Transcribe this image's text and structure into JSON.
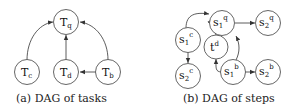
{
  "left": {
    "caption": "(a) DAG of tasks",
    "nodes": [
      {
        "id": "Tq",
        "base": "T",
        "sub": "q"
      },
      {
        "id": "Tc",
        "base": "T",
        "sub": "c"
      },
      {
        "id": "Td",
        "base": "T",
        "sub": "d"
      },
      {
        "id": "Tb",
        "base": "T",
        "sub": "b"
      }
    ],
    "edges": [
      [
        "Tc",
        "Tq"
      ],
      [
        "Td",
        "Tq"
      ],
      [
        "Tb",
        "Tq"
      ],
      [
        "Tb",
        "Td"
      ]
    ]
  },
  "right": {
    "caption": "(b) DAG of steps",
    "nodes": [
      {
        "id": "s1q",
        "base": "s",
        "sub": "1",
        "sup": "q"
      },
      {
        "id": "s2q",
        "base": "s",
        "sub": "2",
        "sup": "q"
      },
      {
        "id": "s1c",
        "base": "s",
        "sub": "1",
        "sup": "c"
      },
      {
        "id": "td",
        "base": "t",
        "sup": "d"
      },
      {
        "id": "s2c",
        "base": "s",
        "sub": "2",
        "sup": "c"
      },
      {
        "id": "s1b",
        "base": "s",
        "sub": "1",
        "sup": "b"
      },
      {
        "id": "s2b",
        "base": "s",
        "sub": "2",
        "sup": "b"
      }
    ],
    "edges": [
      [
        "s1c",
        "s1q"
      ],
      [
        "s1c",
        "s2c"
      ],
      [
        "s1q",
        "s2q"
      ],
      [
        "td",
        "s1q"
      ],
      [
        "s1b",
        "s1q"
      ],
      [
        "s1b",
        "td"
      ],
      [
        "s1b",
        "s2b"
      ]
    ]
  },
  "colors": {
    "node_stroke": "#555555",
    "edge": "#333333",
    "text": "#111111"
  }
}
